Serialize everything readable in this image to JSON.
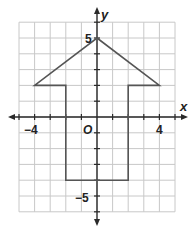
{
  "graph": {
    "x_range": [
      -5,
      5
    ],
    "y_range": [
      -6,
      6
    ],
    "x_axis_label": "x",
    "y_axis_label": "y",
    "origin_label": "O",
    "tick_labels": {
      "x_neg4": "−4",
      "x_pos4": "4",
      "y_pos5": "5",
      "y_neg5": "−5"
    },
    "figure": {
      "name": "arrow-shape",
      "vertices": [
        [
          0,
          5
        ],
        [
          4,
          2
        ],
        [
          2,
          2
        ],
        [
          2,
          -4
        ],
        [
          -2,
          -4
        ],
        [
          -2,
          2
        ],
        [
          -4,
          2
        ]
      ]
    },
    "colors": {
      "grid": "#c8c8c8",
      "axis": "#2a2a2a",
      "shape": "#555555"
    }
  }
}
